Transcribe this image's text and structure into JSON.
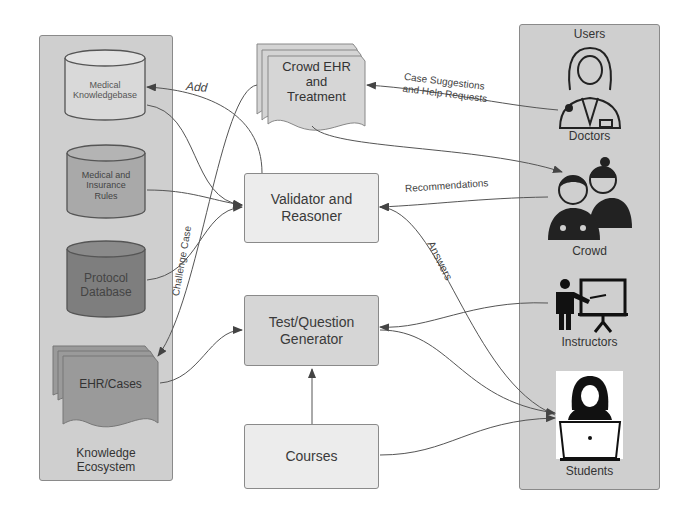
{
  "knowledge_panel": {
    "title": "Knowledge Ecosystem",
    "title_line1": "Knowledge",
    "title_line2": "Ecosystem",
    "items": [
      {
        "id": "medical-kb",
        "line1": "Medical",
        "line2": "Knowledgebase",
        "shape": "database",
        "fill": "#d9d9d9"
      },
      {
        "id": "rules",
        "line1": "Medical and",
        "line2": "Insurance",
        "line3": "Rules",
        "shape": "database",
        "fill": "#a9a9a9"
      },
      {
        "id": "protocol",
        "line1": "Protocol",
        "line2": "Database",
        "shape": "database",
        "fill": "#7e7e7e"
      },
      {
        "id": "ehr",
        "label": "EHR/Cases",
        "shape": "multi-document",
        "fill": "#9a9a9a"
      }
    ]
  },
  "center": {
    "crowd_ehr": {
      "line1": "Crowd EHR",
      "line2": "and",
      "line3": "Treatment"
    },
    "validator": {
      "line1": "Validator and",
      "line2": "Reasoner"
    },
    "generator": {
      "line1": "Test/Question",
      "line2": "Generator"
    },
    "courses": {
      "label": "Courses"
    }
  },
  "users_panel": {
    "title": "Users",
    "actors": [
      {
        "id": "doctors",
        "label": "Doctors",
        "icon": "female-doctor-icon"
      },
      {
        "id": "crowd",
        "label": "Crowd",
        "icon": "medical-crowd-icon"
      },
      {
        "id": "instructors",
        "label": "Instructors",
        "icon": "instructor-whiteboard-icon"
      },
      {
        "id": "students",
        "label": "Students",
        "icon": "student-laptop-icon"
      }
    ]
  },
  "edges": {
    "add": "Add",
    "challenge_case": "Challenge Case",
    "case_suggestions_1": "Case Suggestions",
    "case_suggestions_2": "and Help Requests",
    "recommendations": "Recommendations",
    "answers": "Answers"
  },
  "colors": {
    "panel_bg": "#cfcfcf",
    "box_light": "#ececec",
    "box_mid": "#d6d6d6",
    "stroke": "#555555"
  }
}
